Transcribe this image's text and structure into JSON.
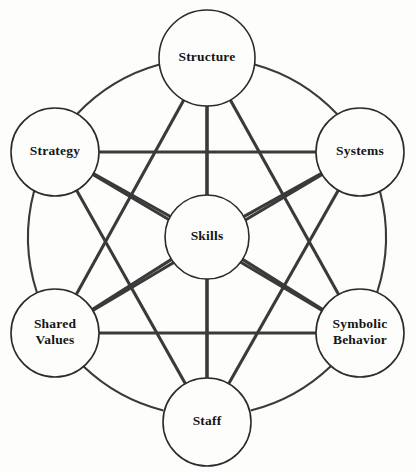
{
  "diagram": {
    "type": "network-diagram",
    "background_color": "#fdfdfb",
    "line_color": "#3a3a3a",
    "text_color": "#151515",
    "nodes": [
      {
        "id": "structure",
        "label": "Structure",
        "lines": [
          "Structure"
        ],
        "cx": 207,
        "cy": 58,
        "r": 48
      },
      {
        "id": "strategy",
        "label": "Strategy",
        "lines": [
          "Strategy"
        ],
        "cx": 55,
        "cy": 152,
        "r": 44
      },
      {
        "id": "systems",
        "label": "Systems",
        "lines": [
          "Systems"
        ],
        "cx": 360,
        "cy": 152,
        "r": 44
      },
      {
        "id": "skills",
        "label": "Skills",
        "lines": [
          "Skills"
        ],
        "cx": 207,
        "cy": 237,
        "r": 42
      },
      {
        "id": "shared",
        "label": "Shared Values",
        "lines": [
          "Shared",
          "Values"
        ],
        "cx": 55,
        "cy": 333,
        "r": 44
      },
      {
        "id": "symbolic",
        "label": "Symbolic Behavior",
        "lines": [
          "Symbolic",
          "Behavior"
        ],
        "cx": 360,
        "cy": 333,
        "r": 44
      },
      {
        "id": "staff",
        "label": "Staff",
        "lines": [
          "Staff"
        ],
        "cx": 207,
        "cy": 422,
        "r": 44
      }
    ],
    "edges": [
      {
        "from": "structure",
        "to": "strategy",
        "style": "arc"
      },
      {
        "from": "structure",
        "to": "systems",
        "style": "arc"
      },
      {
        "from": "strategy",
        "to": "shared",
        "style": "arc"
      },
      {
        "from": "systems",
        "to": "symbolic",
        "style": "arc"
      },
      {
        "from": "shared",
        "to": "staff",
        "style": "arc"
      },
      {
        "from": "symbolic",
        "to": "staff",
        "style": "arc"
      },
      {
        "from": "structure",
        "to": "skills",
        "style": "chord"
      },
      {
        "from": "strategy",
        "to": "skills",
        "style": "chord"
      },
      {
        "from": "systems",
        "to": "skills",
        "style": "chord"
      },
      {
        "from": "shared",
        "to": "skills",
        "style": "chord"
      },
      {
        "from": "symbolic",
        "to": "skills",
        "style": "chord"
      },
      {
        "from": "staff",
        "to": "skills",
        "style": "chord"
      },
      {
        "from": "strategy",
        "to": "systems",
        "style": "chord"
      },
      {
        "from": "shared",
        "to": "symbolic",
        "style": "chord"
      },
      {
        "from": "structure",
        "to": "shared",
        "style": "chord"
      },
      {
        "from": "structure",
        "to": "symbolic",
        "style": "chord"
      },
      {
        "from": "structure",
        "to": "staff",
        "style": "chord"
      },
      {
        "from": "strategy",
        "to": "symbolic",
        "style": "chord"
      },
      {
        "from": "strategy",
        "to": "staff",
        "style": "chord"
      },
      {
        "from": "systems",
        "to": "shared",
        "style": "chord"
      },
      {
        "from": "systems",
        "to": "staff",
        "style": "chord"
      }
    ]
  }
}
